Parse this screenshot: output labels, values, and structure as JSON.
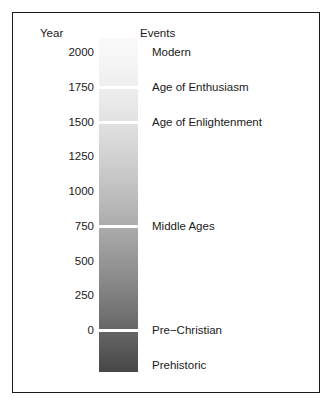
{
  "chart_data": {
    "type": "heatmap",
    "title": "",
    "xlabel": "",
    "ylabel": "Year",
    "ylim": [
      -300,
      2100
    ],
    "grid": false,
    "legend_position": "none",
    "columns": [
      "Year",
      "Events"
    ],
    "axis_ticks": [
      {
        "label": "2000",
        "value": 2000
      },
      {
        "label": "1750",
        "value": 1750
      },
      {
        "label": "1500",
        "value": 1500
      },
      {
        "label": "1250",
        "value": 1250
      },
      {
        "label": "1000",
        "value": 1000
      },
      {
        "label": "750",
        "value": 750
      },
      {
        "label": "500",
        "value": 500
      },
      {
        "label": "250",
        "value": 250
      },
      {
        "label": "0",
        "value": 0
      }
    ],
    "annotations": [
      {
        "label": "Modern",
        "value": 2000
      },
      {
        "label": "Age of Enthusiasm",
        "value": 1750
      },
      {
        "label": "Age of Enlightenment",
        "value": 1500
      },
      {
        "label": "Middle Ages",
        "value": 750
      },
      {
        "label": "Pre−Christian",
        "value": 0
      },
      {
        "label": "Prehistoric",
        "value": -250
      }
    ],
    "bands": [
      {
        "era": "Modern",
        "from": 2100,
        "to": 1750,
        "color": "#f7f7f7"
      },
      {
        "era": "Age of Enthusiasm",
        "from": 1750,
        "to": 1500,
        "color": "#ececec"
      },
      {
        "era": "Age of Enlightenment",
        "from": 1500,
        "to": 750,
        "color": "#c9c9c9"
      },
      {
        "era": "Middle Ages",
        "from": 750,
        "to": 0,
        "color": "#6f6f6f"
      },
      {
        "era": "Prehistoric",
        "from": 0,
        "to": -300,
        "color": "#4a4a4a"
      }
    ],
    "gradient_endpoints": {
      "top": "#f9f9f9",
      "bottom": "#474747"
    }
  },
  "header": {
    "year": "Year",
    "events": "Events"
  },
  "colors": {
    "border": "#1a1a1a",
    "text": "#1a1a1a",
    "background": "#ffffff",
    "separator": "#ffffff"
  }
}
